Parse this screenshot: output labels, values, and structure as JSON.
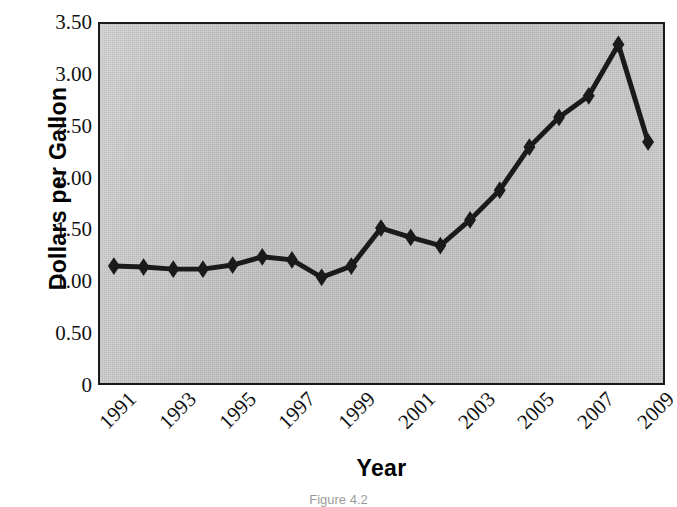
{
  "chart_data": {
    "type": "line",
    "title": "",
    "xlabel": "Year",
    "ylabel": "Dollars per Gallon",
    "x": [
      1991,
      1992,
      1993,
      1994,
      1995,
      1996,
      1997,
      1998,
      1999,
      2000,
      2001,
      2002,
      2003,
      2004,
      2005,
      2006,
      2007,
      2008,
      2009
    ],
    "values": [
      1.14,
      1.13,
      1.11,
      1.11,
      1.15,
      1.23,
      1.2,
      1.03,
      1.14,
      1.51,
      1.42,
      1.34,
      1.59,
      1.88,
      2.3,
      2.59,
      2.8,
      3.3,
      2.35
    ],
    "xlim": [
      1991,
      2009
    ],
    "ylim": [
      0,
      3.5
    ],
    "ytick_labels": [
      "3.50",
      "3.00",
      "2.50",
      "2.00",
      "1.50",
      "1.00",
      "0.50",
      "0"
    ],
    "ytick_values": [
      3.5,
      3.0,
      2.5,
      2.0,
      1.5,
      1.0,
      0.5,
      0
    ],
    "xtick_labels": [
      "1991",
      "1993",
      "1995",
      "1997",
      "1999",
      "2001",
      "2003",
      "2005",
      "2007",
      "2009"
    ],
    "xtick_values": [
      1991,
      1993,
      1995,
      1997,
      1999,
      2001,
      2003,
      2005,
      2007,
      2009
    ],
    "grid": false,
    "legend": false,
    "marker": "diamond",
    "series_color": "#1a1a1a",
    "plot_background": "#c2c2c2",
    "frame_color": "#1a1a1a",
    "caption": "Figure 4.2"
  }
}
